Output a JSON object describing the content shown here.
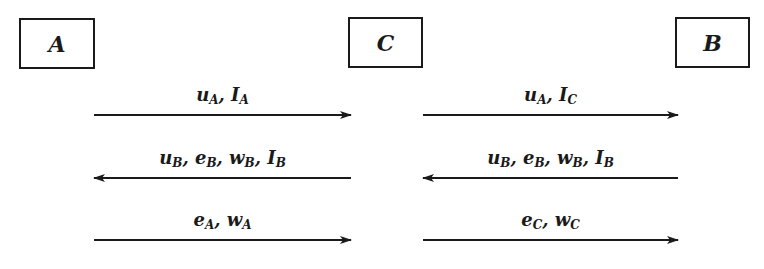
{
  "entities": [
    {
      "id": "A",
      "label": "A",
      "x": 19,
      "y": 18,
      "w": 76,
      "h": 51
    },
    {
      "id": "C",
      "label": "C",
      "x": 348,
      "y": 17,
      "w": 75,
      "h": 51
    },
    {
      "id": "B",
      "label": "B",
      "x": 675,
      "y": 17,
      "w": 75,
      "h": 51
    }
  ],
  "messages": [
    {
      "from": "A",
      "to": "C",
      "direction": "right",
      "row": 1,
      "parts": [
        {
          "base": "u",
          "sub": "A"
        },
        {
          "base": "I",
          "sub": "A"
        }
      ]
    },
    {
      "from": "C",
      "to": "B",
      "direction": "right",
      "row": 1,
      "parts": [
        {
          "base": "u",
          "sub": "A"
        },
        {
          "base": "I",
          "sub": "C"
        }
      ]
    },
    {
      "from": "C",
      "to": "A",
      "direction": "left",
      "row": 2,
      "parts": [
        {
          "base": "u",
          "sub": "B"
        },
        {
          "base": "e",
          "sub": "B"
        },
        {
          "base": "w",
          "sub": "B"
        },
        {
          "base": "I",
          "sub": "B"
        }
      ]
    },
    {
      "from": "B",
      "to": "C",
      "direction": "left",
      "row": 2,
      "parts": [
        {
          "base": "u",
          "sub": "B"
        },
        {
          "base": "e",
          "sub": "B"
        },
        {
          "base": "w",
          "sub": "B"
        },
        {
          "base": "I",
          "sub": "B"
        }
      ]
    },
    {
      "from": "A",
      "to": "C",
      "direction": "right",
      "row": 3,
      "parts": [
        {
          "base": "e",
          "sub": "A"
        },
        {
          "base": "w",
          "sub": "A"
        }
      ]
    },
    {
      "from": "C",
      "to": "B",
      "direction": "right",
      "row": 3,
      "parts": [
        {
          "base": "e",
          "sub": "C"
        },
        {
          "base": "w",
          "sub": "C"
        }
      ]
    }
  ],
  "layout": {
    "rows_y": {
      "1": 115,
      "2": 178,
      "3": 240
    },
    "left_span": [
      94,
      351
    ],
    "right_span": [
      423,
      678
    ]
  },
  "colors": {
    "ink": "#1a1a1a",
    "background": "#ffffff"
  }
}
